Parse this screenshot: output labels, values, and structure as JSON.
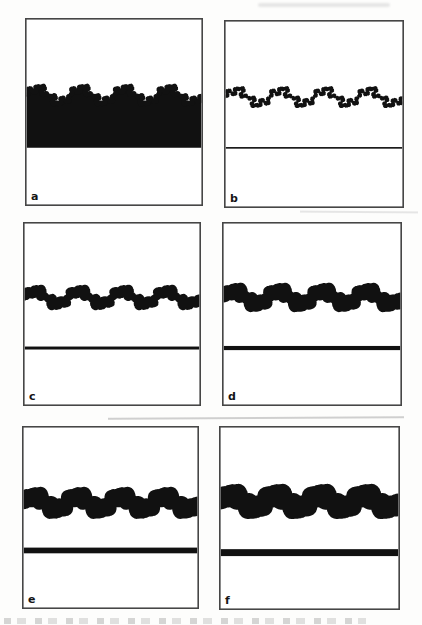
{
  "figure": {
    "colors": {
      "ink": "#111111",
      "border": "#464646",
      "background": "#ffffff"
    },
    "panels": [
      {
        "label": "a",
        "kind": "filled",
        "curve": {
          "center": 0.41,
          "amplitude": 0.05,
          "iterations": 2,
          "stroke": 3
        },
        "fill_to": 0.69
      },
      {
        "label": "b",
        "kind": "curve",
        "curve": {
          "center": 0.41,
          "amplitude": 0.05,
          "iterations": 2,
          "stroke": 2.2
        },
        "line": {
          "y": 0.68,
          "thickness": 1.6
        }
      },
      {
        "label": "c",
        "kind": "curve",
        "curve": {
          "center": 0.41,
          "amplitude": 0.05,
          "iterations": 2,
          "stroke": 6
        },
        "line": {
          "y": 0.685,
          "thickness": 3
        }
      },
      {
        "label": "d",
        "kind": "curve",
        "curve": {
          "center": 0.41,
          "amplitude": 0.05,
          "iterations": 2,
          "stroke": 10
        },
        "line": {
          "y": 0.685,
          "thickness": 4.2
        }
      },
      {
        "label": "e",
        "kind": "curve",
        "curve": {
          "center": 0.42,
          "amplitude": 0.05,
          "iterations": 2,
          "stroke": 13
        },
        "line": {
          "y": 0.68,
          "thickness": 5.8
        }
      },
      {
        "label": "f",
        "kind": "curve",
        "curve": {
          "center": 0.41,
          "amplitude": 0.05,
          "iterations": 2,
          "stroke": 16
        },
        "line": {
          "y": 0.688,
          "thickness": 7
        }
      }
    ]
  }
}
